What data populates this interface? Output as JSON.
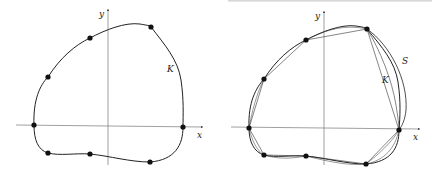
{
  "figure": {
    "left_panel": {
      "axis_labels": {
        "x": "x",
        "y": "y"
      },
      "curve_label": "K",
      "num_points": 8
    },
    "right_panel": {
      "axis_labels": {
        "x": "x",
        "y": "y"
      },
      "curve_labels": {
        "inner": "K",
        "outer": "S"
      },
      "num_points": 8
    }
  }
}
